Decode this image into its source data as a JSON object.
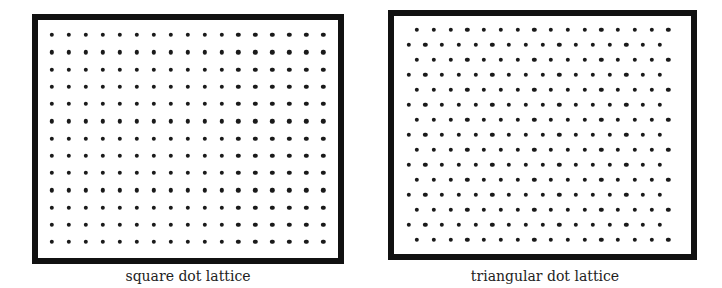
{
  "panels": [
    {
      "id": "square",
      "caption": "square dot lattice",
      "type": "square",
      "rows": 13,
      "cols": 17,
      "border": {
        "left": 32,
        "top": 14,
        "right": 344,
        "bottom": 264
      },
      "first_dot": {
        "x": 52,
        "y": 35
      },
      "dx": 16.95,
      "dy": 17.25,
      "caption_center_x": 188,
      "caption_top": 268
    },
    {
      "id": "triangular",
      "caption": "triangular dot lattice",
      "type": "triangular",
      "rows": 15,
      "cols": 16,
      "border": {
        "left": 388,
        "top": 10,
        "right": 697,
        "bottom": 260
      },
      "first_dot": {
        "x": 417,
        "y": 30
      },
      "offset_row_shift": -8.4,
      "dx": 16.75,
      "dy": 15.0,
      "caption_center_x": 545,
      "caption_top": 268
    }
  ],
  "colors": {
    "border": "#111111",
    "dot": "#1a1a1a",
    "background": "#ffffff",
    "caption": "#222222"
  }
}
